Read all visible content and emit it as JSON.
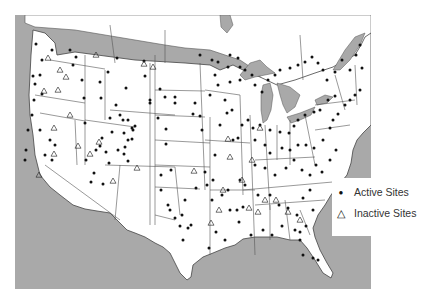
{
  "map": {
    "title": "",
    "region": "Contiguous United States",
    "colors": {
      "water": "#a9a9a9",
      "land": "#ffffff",
      "border": "#555555",
      "active_marker": "#111111",
      "inactive_marker": "#444444"
    }
  },
  "legend": {
    "items": [
      {
        "symbol": "filled-dot",
        "glyph": "●",
        "label": "Active Sites"
      },
      {
        "symbol": "open-triangle",
        "glyph": "△",
        "label": "Inactive Sites"
      }
    ]
  },
  "sites": {
    "active": [
      [
        36,
        44
      ],
      [
        42,
        60
      ],
      [
        52,
        50
      ],
      [
        40,
        75
      ],
      [
        33,
        76
      ],
      [
        35,
        84
      ],
      [
        42,
        94
      ],
      [
        34,
        100
      ],
      [
        32,
        115
      ],
      [
        28,
        130
      ],
      [
        40,
        130
      ],
      [
        50,
        140
      ],
      [
        55,
        145
      ],
      [
        26,
        150
      ],
      [
        45,
        155
      ],
      [
        52,
        160
      ],
      [
        25,
        160
      ],
      [
        70,
        50
      ],
      [
        76,
        57
      ],
      [
        73,
        65
      ],
      [
        82,
        80
      ],
      [
        84,
        98
      ],
      [
        100,
        82
      ],
      [
        101,
        98
      ],
      [
        108,
        72
      ],
      [
        117,
        58
      ],
      [
        126,
        88
      ],
      [
        144,
        61
      ],
      [
        145,
        76
      ],
      [
        160,
        89
      ],
      [
        165,
        97
      ],
      [
        175,
        97
      ],
      [
        150,
        100
      ],
      [
        150,
        103
      ],
      [
        175,
        103
      ],
      [
        116,
        105
      ],
      [
        110,
        118
      ],
      [
        120,
        115
      ],
      [
        123,
        120
      ],
      [
        128,
        120
      ],
      [
        132,
        128
      ],
      [
        135,
        126
      ],
      [
        132,
        139
      ],
      [
        124,
        133
      ],
      [
        112,
        132
      ],
      [
        102,
        138
      ],
      [
        96,
        150
      ],
      [
        100,
        146
      ],
      [
        106,
        152
      ],
      [
        118,
        150
      ],
      [
        128,
        140
      ],
      [
        133,
        130
      ],
      [
        85,
        123
      ],
      [
        86,
        160
      ],
      [
        91,
        182
      ],
      [
        94,
        173
      ],
      [
        103,
        184
      ],
      [
        109,
        163
      ],
      [
        124,
        154
      ],
      [
        128,
        161
      ],
      [
        125,
        147
      ],
      [
        158,
        118
      ],
      [
        166,
        129
      ],
      [
        166,
        144
      ],
      [
        193,
        114
      ],
      [
        195,
        103
      ],
      [
        200,
        116
      ],
      [
        202,
        130
      ],
      [
        210,
        95
      ],
      [
        218,
        85
      ],
      [
        215,
        75
      ],
      [
        228,
        67
      ],
      [
        230,
        82
      ],
      [
        240,
        80
      ],
      [
        225,
        100
      ],
      [
        232,
        110
      ],
      [
        220,
        125
      ],
      [
        227,
        113
      ],
      [
        233,
        140
      ],
      [
        215,
        155
      ],
      [
        205,
        172
      ],
      [
        207,
        185
      ],
      [
        213,
        180
      ],
      [
        228,
        190
      ],
      [
        245,
        185
      ],
      [
        240,
        180
      ],
      [
        230,
        210
      ],
      [
        237,
        210
      ],
      [
        222,
        195
      ],
      [
        212,
        200
      ],
      [
        196,
        188
      ],
      [
        185,
        200
      ],
      [
        171,
        170
      ],
      [
        161,
        175
      ],
      [
        161,
        190
      ],
      [
        170,
        210
      ],
      [
        175,
        218
      ],
      [
        182,
        215
      ],
      [
        188,
        228
      ],
      [
        191,
        225
      ],
      [
        183,
        240
      ],
      [
        180,
        226
      ],
      [
        168,
        205
      ],
      [
        200,
        55
      ],
      [
        212,
        60
      ],
      [
        218,
        62
      ],
      [
        230,
        55
      ],
      [
        238,
        58
      ],
      [
        240,
        67
      ],
      [
        245,
        70
      ],
      [
        252,
        75
      ],
      [
        255,
        85
      ],
      [
        262,
        92
      ],
      [
        268,
        80
      ],
      [
        275,
        75
      ],
      [
        280,
        70
      ],
      [
        290,
        68
      ],
      [
        298,
        65
      ],
      [
        305,
        62
      ],
      [
        312,
        57
      ],
      [
        318,
        63
      ],
      [
        323,
        70
      ],
      [
        327,
        80
      ],
      [
        335,
        72
      ],
      [
        342,
        60
      ],
      [
        350,
        70
      ],
      [
        356,
        55
      ],
      [
        360,
        45
      ],
      [
        362,
        68
      ],
      [
        360,
        90
      ],
      [
        355,
        95
      ],
      [
        350,
        100
      ],
      [
        345,
        105
      ],
      [
        335,
        96
      ],
      [
        328,
        100
      ],
      [
        320,
        110
      ],
      [
        314,
        112
      ],
      [
        305,
        115
      ],
      [
        298,
        120
      ],
      [
        294,
        126
      ],
      [
        289,
        133
      ],
      [
        280,
        132
      ],
      [
        270,
        130
      ],
      [
        260,
        125
      ],
      [
        253,
        128
      ],
      [
        248,
        120
      ],
      [
        242,
        125
      ],
      [
        238,
        138
      ],
      [
        255,
        140
      ],
      [
        265,
        145
      ],
      [
        270,
        153
      ],
      [
        282,
        148
      ],
      [
        290,
        150
      ],
      [
        298,
        145
      ],
      [
        306,
        145
      ],
      [
        314,
        148
      ],
      [
        323,
        140
      ],
      [
        330,
        128
      ],
      [
        333,
        120
      ],
      [
        338,
        114
      ],
      [
        255,
        165
      ],
      [
        265,
        168
      ],
      [
        275,
        175
      ],
      [
        286,
        168
      ],
      [
        294,
        160
      ],
      [
        302,
        170
      ],
      [
        310,
        175
      ],
      [
        316,
        165
      ],
      [
        322,
        172
      ],
      [
        330,
        160
      ],
      [
        336,
        150
      ],
      [
        243,
        207
      ],
      [
        258,
        195
      ],
      [
        270,
        195
      ],
      [
        279,
        205
      ],
      [
        288,
        208
      ],
      [
        297,
        215
      ],
      [
        303,
        198
      ],
      [
        310,
        190
      ],
      [
        313,
        210
      ],
      [
        295,
        230
      ],
      [
        282,
        226
      ],
      [
        272,
        235
      ],
      [
        263,
        230
      ],
      [
        251,
        235
      ],
      [
        239,
        222
      ],
      [
        225,
        240
      ],
      [
        216,
        232
      ],
      [
        209,
        248
      ],
      [
        306,
        226
      ],
      [
        300,
        232
      ],
      [
        300,
        240
      ],
      [
        303,
        255
      ],
      [
        313,
        258
      ],
      [
        318,
        260
      ]
    ],
    "inactive": [
      [
        48,
        58
      ],
      [
        60,
        70
      ],
      [
        66,
        77
      ],
      [
        58,
        90
      ],
      [
        44,
        91
      ],
      [
        54,
        128
      ],
      [
        39,
        175
      ],
      [
        54,
        154
      ],
      [
        78,
        146
      ],
      [
        96,
        55
      ],
      [
        144,
        64
      ],
      [
        153,
        67
      ],
      [
        70,
        115
      ],
      [
        90,
        154
      ],
      [
        99,
        142
      ],
      [
        137,
        168
      ],
      [
        113,
        181
      ],
      [
        194,
        171
      ],
      [
        223,
        190
      ],
      [
        249,
        208
      ],
      [
        258,
        212
      ],
      [
        265,
        200
      ],
      [
        211,
        223
      ],
      [
        219,
        210
      ],
      [
        242,
        180
      ],
      [
        228,
        139
      ],
      [
        260,
        128
      ],
      [
        252,
        160
      ],
      [
        230,
        157
      ],
      [
        276,
        200
      ],
      [
        288,
        212
      ],
      [
        300,
        220
      ]
    ]
  }
}
